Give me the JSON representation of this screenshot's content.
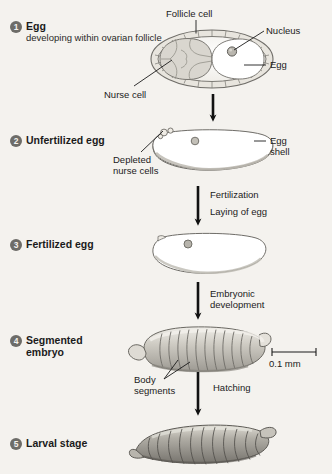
{
  "figure": {
    "background_color": "#f4f2ee",
    "badge_color": "#6d6c68",
    "text_color": "#1b1b1b"
  },
  "stages": [
    {
      "number": "1",
      "title": "Egg",
      "subtitle": "developing within\novarian follicle"
    },
    {
      "number": "2",
      "title": "Unfertilized egg",
      "subtitle": ""
    },
    {
      "number": "3",
      "title": "Fertilized egg",
      "subtitle": ""
    },
    {
      "number": "4",
      "title": "Segmented\nembryo",
      "subtitle": ""
    },
    {
      "number": "5",
      "title": "Larval stage",
      "subtitle": ""
    }
  ],
  "callouts": {
    "follicle_cell": "Follicle cell",
    "nucleus": "Nucleus",
    "egg": "Egg",
    "nurse_cell": "Nurse cell",
    "depleted_nurse_cells": "Depleted\nnurse cells",
    "egg_shell": "Egg\nshell",
    "body_segments": "Body\nsegments"
  },
  "transitions": {
    "fertilization": "Fertilization",
    "laying_of_egg": "Laying of egg",
    "embryonic_development": "Embryonic\ndevelopment",
    "hatching": "Hatching"
  },
  "scale_bar": {
    "label": "0.1 mm"
  }
}
